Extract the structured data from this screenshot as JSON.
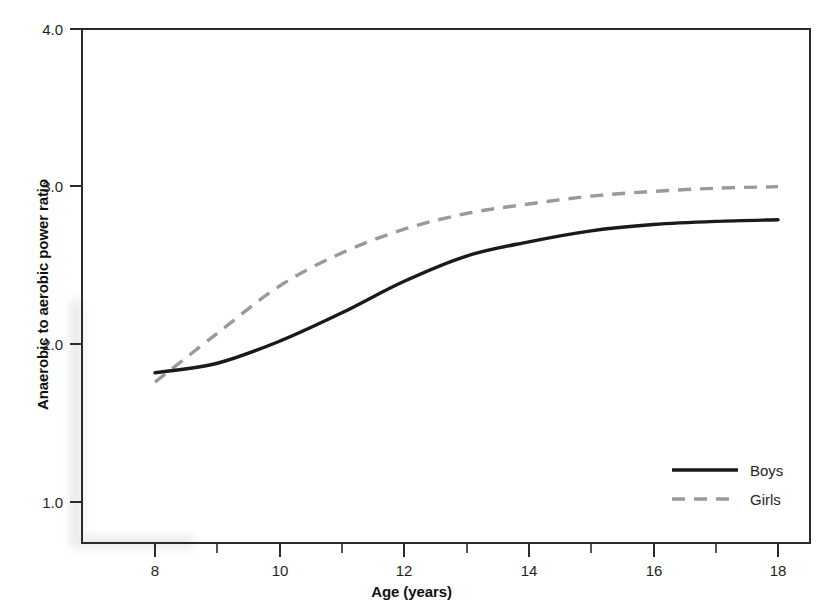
{
  "figure": {
    "kind": "scientific-line-chart",
    "background": "#ffffff"
  },
  "axes": {
    "y_title": "Anaerobic to aerobic power ratio",
    "x_title": "Age (years)"
  },
  "colors": {
    "boys_line": "#1a1a1a",
    "girls_line": "#9a9a9a",
    "axis": "#2b2b2b",
    "text": "#1f1f1f"
  },
  "chart_data": {
    "type": "line",
    "title": "",
    "xlabel": "Age (years)",
    "ylabel": "Anaerobic to aerobic power ratio",
    "xlim": [
      7.6,
      18.5
    ],
    "ylim": [
      0.82,
      4.0
    ],
    "grid": false,
    "legend_position": "bottom-right",
    "x_ticks": [
      8,
      10,
      12,
      14,
      16,
      18
    ],
    "x_tick_labels": [
      "8",
      "10",
      "12",
      "14",
      "16",
      "18"
    ],
    "x_minor_ticks": [
      9,
      11,
      13,
      15,
      17
    ],
    "y_ticks": [
      1.0,
      2.0,
      3.0,
      4.0
    ],
    "y_tick_labels": [
      "1.0",
      "2.0",
      "3.0",
      "4.0"
    ],
    "x": [
      8,
      9,
      10,
      11,
      12,
      13,
      14,
      15,
      16,
      17,
      18
    ],
    "series": [
      {
        "name": "Boys",
        "style": "solid",
        "color": "#1a1a1a",
        "values": [
          1.82,
          1.88,
          2.02,
          2.2,
          2.4,
          2.56,
          2.65,
          2.72,
          2.76,
          2.78,
          2.79
        ]
      },
      {
        "name": "Girls",
        "style": "dashed",
        "color": "#9a9a9a",
        "values": [
          1.76,
          2.07,
          2.37,
          2.58,
          2.73,
          2.83,
          2.89,
          2.94,
          2.97,
          2.99,
          3.0
        ]
      }
    ]
  },
  "legend": {
    "items": [
      {
        "label": "Boys",
        "style": "solid",
        "color": "#1a1a1a"
      },
      {
        "label": "Girls",
        "style": "dashed",
        "color": "#9a9a9a"
      }
    ]
  }
}
